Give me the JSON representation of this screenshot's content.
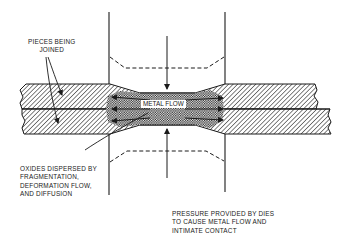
{
  "diagram": {
    "type": "cross-section schematic",
    "labels": {
      "pieces": [
        "PIECES BEING",
        "JOINED"
      ],
      "metal_flow": "METAL FLOW",
      "oxides": [
        "OXIDES DISPERSED BY",
        "FRAGMENTATION,",
        "DEFORMATION FLOW,",
        "AND DIFFUSION"
      ],
      "pressure": [
        "PRESSURE PROVIDED BY DIES",
        "TO CAUSE METAL FLOW AND",
        "INTIMATE CONTACT"
      ]
    },
    "elements": [
      {
        "name": "upper-die",
        "style": "solid outline with dashed tip profile"
      },
      {
        "name": "lower-die",
        "style": "solid outline with dashed tip profile"
      },
      {
        "name": "upper-piece",
        "fill": "diagonal hatch"
      },
      {
        "name": "lower-piece",
        "fill": "diagonal hatch"
      },
      {
        "name": "weld-zone",
        "fill": "cross-hatch / checkered"
      },
      {
        "name": "pressure-arrow-down"
      },
      {
        "name": "pressure-arrow-up"
      },
      {
        "name": "metal-flow-arrows",
        "count": 6
      }
    ],
    "colors": {
      "ink": "#1a1a1a",
      "background": "#ffffff"
    }
  }
}
